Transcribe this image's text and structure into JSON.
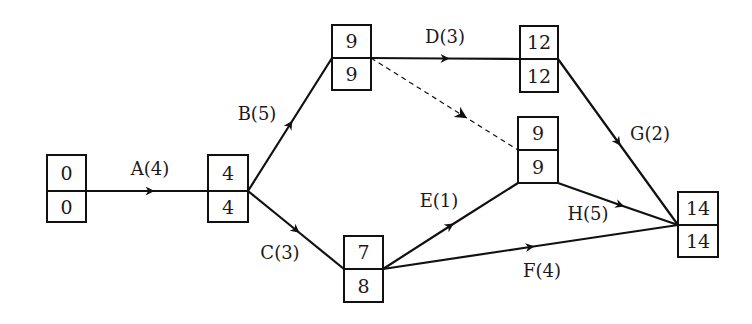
{
  "diagram": {
    "type": "activity-on-arrow network (critical path)",
    "nodes": [
      {
        "id": "n1",
        "top": "0",
        "bottom": "0",
        "x": 47,
        "y": 155,
        "w": 39,
        "h": 67
      },
      {
        "id": "n2",
        "top": "4",
        "bottom": "4",
        "x": 208,
        "y": 155,
        "w": 40,
        "h": 67
      },
      {
        "id": "n3",
        "top": "9",
        "bottom": "9",
        "x": 332,
        "y": 25,
        "w": 39,
        "h": 65
      },
      {
        "id": "n4",
        "top": "12",
        "bottom": "12",
        "x": 520,
        "y": 26,
        "w": 38,
        "h": 66
      },
      {
        "id": "n5",
        "top": "9",
        "bottom": "9",
        "x": 518,
        "y": 117,
        "w": 40,
        "h": 66
      },
      {
        "id": "n6",
        "top": "7",
        "bottom": "8",
        "x": 344,
        "y": 236,
        "w": 39,
        "h": 66
      },
      {
        "id": "n7",
        "top": "14",
        "bottom": "14",
        "x": 678,
        "y": 192,
        "w": 40,
        "h": 65
      }
    ],
    "edges": [
      {
        "id": "A",
        "label": "A(4)",
        "from": "n1",
        "to": "n2",
        "dashed": false
      },
      {
        "id": "B",
        "label": "B(5)",
        "from": "n2",
        "to": "n3",
        "dashed": false
      },
      {
        "id": "C",
        "label": "C(3)",
        "from": "n2",
        "to": "n6",
        "dashed": false
      },
      {
        "id": "D",
        "label": "D(3)",
        "from": "n3",
        "to": "n4",
        "dashed": false
      },
      {
        "id": "dummy",
        "label": "",
        "from": "n3",
        "to": "n5",
        "dashed": true
      },
      {
        "id": "E",
        "label": "E(1)",
        "from": "n6",
        "to": "n5",
        "dashed": false
      },
      {
        "id": "F",
        "label": "F(4)",
        "from": "n6",
        "to": "n7",
        "dashed": false
      },
      {
        "id": "G",
        "label": "G(2)",
        "from": "n4",
        "to": "n7",
        "dashed": false
      },
      {
        "id": "H",
        "label": "H(5)",
        "from": "n5",
        "to": "n7",
        "dashed": false
      }
    ]
  }
}
